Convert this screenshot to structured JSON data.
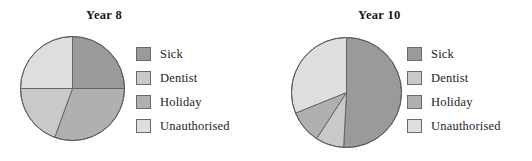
{
  "page": {
    "ghost_text": "",
    "background": "#ffffff"
  },
  "palette": {
    "sick": "#9a9a9a",
    "dentist": "#c9c9c9",
    "holiday": "#b0b0b0",
    "unauthorised": "#dedede",
    "outline": "#5d5d5d",
    "text": "#1c1c1c"
  },
  "legend": {
    "items": [
      {
        "key": "sick",
        "label": "Sick",
        "color": "#9a9a9a"
      },
      {
        "key": "dentist",
        "label": "Dentist",
        "color": "#c9c9c9"
      },
      {
        "key": "holiday",
        "label": "Holiday",
        "color": "#b0b0b0"
      },
      {
        "key": "unauthorised",
        "label": "Unauthorised",
        "color": "#dedede"
      }
    ]
  },
  "charts": [
    {
      "id": "year-8",
      "title": "Year 8",
      "center": {
        "x": 53.5,
        "y": 53.5
      },
      "radius": 52,
      "slices": [
        {
          "key": "sick",
          "label": "Sick",
          "start_deg": 0,
          "end_deg": 90,
          "color": "#9a9a9a"
        },
        {
          "key": "holiday",
          "label": "Holiday",
          "start_deg": 90,
          "end_deg": 200,
          "color": "#b0b0b0"
        },
        {
          "key": "dentist",
          "label": "Dentist",
          "start_deg": 200,
          "end_deg": 270,
          "color": "#c9c9c9"
        },
        {
          "key": "unauthorised",
          "label": "Unauthorised",
          "start_deg": 270,
          "end_deg": 360,
          "color": "#dedede"
        }
      ]
    },
    {
      "id": "year-10",
      "title": "Year 10",
      "center": {
        "x": 56.5,
        "y": 56.5
      },
      "radius": 55,
      "slices": [
        {
          "key": "sick",
          "label": "Sick",
          "start_deg": 0,
          "end_deg": 183,
          "color": "#9a9a9a"
        },
        {
          "key": "dentist",
          "label": "Dentist",
          "start_deg": 183,
          "end_deg": 213,
          "color": "#c9c9c9"
        },
        {
          "key": "holiday",
          "label": "Holiday",
          "start_deg": 213,
          "end_deg": 248,
          "color": "#b0b0b0"
        },
        {
          "key": "unauthorised",
          "label": "Unauthorised",
          "start_deg": 248,
          "end_deg": 360,
          "color": "#dedede"
        }
      ]
    }
  ],
  "chart_data": [
    {
      "type": "pie",
      "title": "Year 8",
      "labels": [
        "Sick",
        "Dentist",
        "Holiday",
        "Unauthorised"
      ],
      "values": [
        25,
        19,
        31,
        25
      ],
      "units": "percent",
      "start_angle_deg": 0,
      "direction": "clockwise",
      "colors": [
        "#9a9a9a",
        "#c9c9c9",
        "#b0b0b0",
        "#dedede"
      ],
      "legend_position": "right",
      "grid": false,
      "xlabel": "",
      "ylabel": ""
    },
    {
      "type": "pie",
      "title": "Year 10",
      "labels": [
        "Sick",
        "Dentist",
        "Holiday",
        "Unauthorised"
      ],
      "values": [
        51,
        8,
        10,
        31
      ],
      "units": "percent",
      "start_angle_deg": 0,
      "direction": "clockwise",
      "colors": [
        "#9a9a9a",
        "#c9c9c9",
        "#b0b0b0",
        "#dedede"
      ],
      "legend_position": "right",
      "grid": false,
      "xlabel": "",
      "ylabel": ""
    }
  ]
}
